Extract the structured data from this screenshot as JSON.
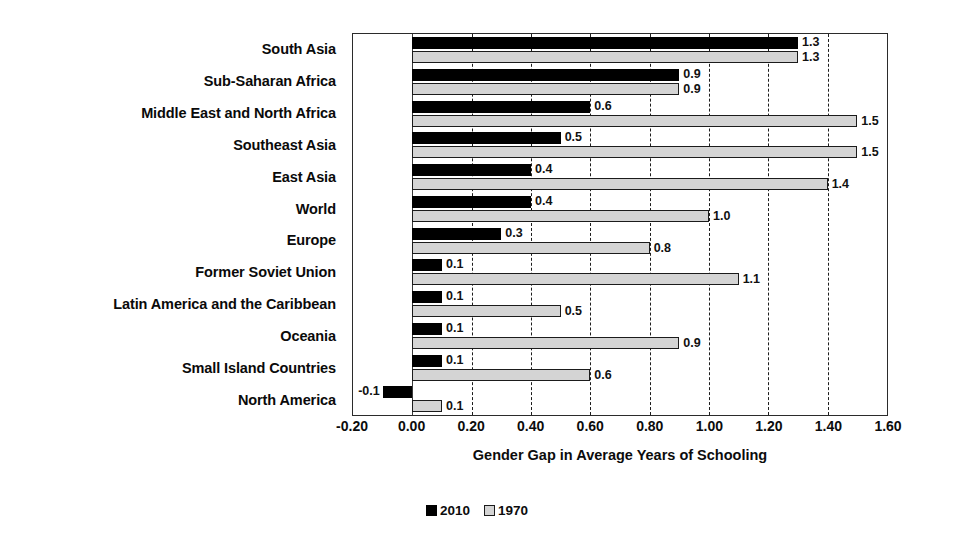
{
  "chart_data": {
    "type": "bar",
    "orientation": "horizontal",
    "title": "",
    "xlabel": "Gender Gap in Average Years of Schooling",
    "ylabel": "",
    "xlim": [
      -0.2,
      1.6
    ],
    "xticks": [
      "-0.20",
      "0.00",
      "0.20",
      "0.40",
      "0.60",
      "0.80",
      "1.00",
      "1.20",
      "1.40",
      "1.60"
    ],
    "xtick_values": [
      -0.2,
      0.0,
      0.2,
      0.4,
      0.6,
      0.8,
      1.0,
      1.2,
      1.4,
      1.6
    ],
    "grid": "vertical-dashed",
    "legend_position": "bottom-center",
    "categories": [
      "South Asia",
      "Sub-Saharan Africa",
      "Middle East and North Africa",
      "Southeast Asia",
      "East Asia",
      "World",
      "Europe",
      "Former Soviet Union",
      "Latin America and the Caribbean",
      "Oceania",
      "Small Island Countries",
      "North America"
    ],
    "series": [
      {
        "name": "2010",
        "color": "#000000",
        "values": [
          1.3,
          0.9,
          0.6,
          0.5,
          0.4,
          0.4,
          0.3,
          0.1,
          0.1,
          0.1,
          0.1,
          -0.1
        ],
        "labels": [
          "1.3",
          "0.9",
          "0.6",
          "0.5",
          "0.4",
          "0.4",
          "0.3",
          "0.1",
          "0.1",
          "0.1",
          "0.1",
          "-0.1"
        ]
      },
      {
        "name": "1970",
        "color": "#d4d4d4",
        "values": [
          1.3,
          0.9,
          1.5,
          1.5,
          1.4,
          1.0,
          0.8,
          1.1,
          0.5,
          0.9,
          0.6,
          0.1
        ],
        "labels": [
          "1.3",
          "0.9",
          "1.5",
          "1.5",
          "1.4",
          "1.0",
          "0.8",
          "1.1",
          "0.5",
          "0.9",
          "0.6",
          "0.1"
        ]
      }
    ]
  },
  "legend": {
    "items": [
      {
        "label": "2010",
        "swatch": "dark-square-icon"
      },
      {
        "label": "1970",
        "swatch": "light-square-icon"
      }
    ]
  }
}
